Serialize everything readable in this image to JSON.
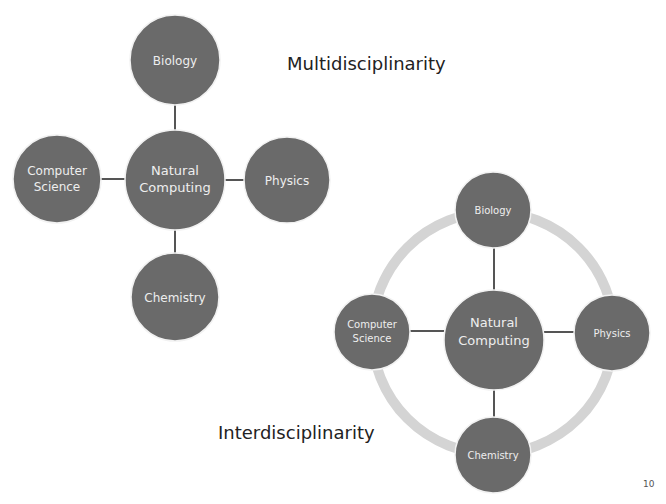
{
  "slide": {
    "page_number": "10",
    "colors": {
      "background": "#ffffff",
      "node_fill": "#6a6a6a",
      "node_stroke": "#f2f2f2",
      "connector": "#555555",
      "ring": "#d4d4d4",
      "node_text": "#eeeeee",
      "title_text": "#222222"
    }
  },
  "multidisciplinarity": {
    "title": "Multidisciplinarity",
    "center": {
      "line1": "Natural",
      "line2": "Computing"
    },
    "top": {
      "label": "Biology"
    },
    "left": {
      "line1": "Computer",
      "line2": "Science"
    },
    "right": {
      "label": "Physics"
    },
    "bottom": {
      "label": "Chemistry"
    }
  },
  "interdisciplinarity": {
    "title": "Interdisciplinarity",
    "center": {
      "line1": "Natural",
      "line2": "Computing"
    },
    "top": {
      "label": "Biology"
    },
    "left": {
      "line1": "Computer",
      "line2": "Science"
    },
    "right": {
      "label": "Physics"
    },
    "bottom": {
      "label": "Chemistry"
    }
  }
}
